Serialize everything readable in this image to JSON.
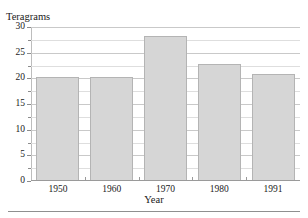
{
  "figure": {
    "clipped_heading_fragment": "I",
    "bottom_rule": true
  },
  "chart_data": {
    "type": "bar",
    "title": "",
    "subtitle": "",
    "xlabel": "Year",
    "ylabel": "Teragrams",
    "categories": [
      "1950",
      "1960",
      "1970",
      "1980",
      "1991"
    ],
    "values": [
      20.3,
      20.2,
      28.3,
      22.7,
      20.8
    ],
    "series": [
      {
        "name": "Teragrams",
        "values": [
          20.3,
          20.2,
          28.3,
          22.7,
          20.8
        ]
      }
    ],
    "ylim": [
      0,
      30
    ],
    "xlim": [
      0,
      5
    ],
    "ytick_labels": [
      "0",
      "5",
      "10",
      "15",
      "20",
      "25",
      "30"
    ],
    "ytick_values": [
      0,
      5,
      10,
      15,
      20,
      25,
      30
    ],
    "gridlines": [
      2.5,
      5,
      7.5,
      10,
      12.5,
      15,
      17.5,
      20,
      22.5,
      25,
      27.5,
      30
    ],
    "grid": true,
    "grid_interval": 2.5,
    "legend": "none",
    "bar_color": "#d6d6d6",
    "bar_edge_color": "#b4b4b4",
    "grid_color": "#c9c9c9",
    "axis_color": "#8c8c8c",
    "background": "#ffffff"
  }
}
